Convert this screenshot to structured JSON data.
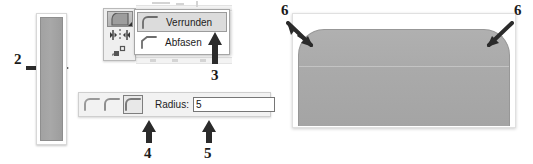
{
  "figure": {
    "callouts": [
      {
        "id": "2",
        "label": "2",
        "target": "rounded-rectangle-preview-bar"
      },
      {
        "id": "3",
        "label": "3",
        "target": "fillet-chamfer-dropdown"
      },
      {
        "id": "4",
        "label": "4",
        "target": "corner-style-button-rounded"
      },
      {
        "id": "5",
        "label": "5",
        "target": "radius-input"
      },
      {
        "id": "6a",
        "label": "6",
        "target": "top-left-rounded-corner"
      },
      {
        "id": "6b",
        "label": "6",
        "target": "top-right-rounded-corner"
      }
    ]
  },
  "preview_bar": {
    "name": "vertical-shape-bar"
  },
  "corner_toolbar": {
    "buttons": [
      {
        "icon": "fillet-corner-icon",
        "active": true,
        "has_dropdown": true
      },
      {
        "icon": "mirror-icon",
        "active": false,
        "has_dropdown": false
      },
      {
        "icon": "rotate-copy-icon",
        "active": false,
        "has_dropdown": false
      }
    ]
  },
  "dropdown": {
    "name": "fillet-chamfer-menu",
    "items": [
      {
        "label": "Verrunden",
        "icon": "rounded-corner-icon",
        "selected": true
      },
      {
        "label": "Abfasen",
        "icon": "chamfer-corner-icon",
        "selected": false
      }
    ]
  },
  "radius_toolbar": {
    "corner_styles": [
      {
        "icon": "corner-style-sharp-icon",
        "active": false
      },
      {
        "icon": "corner-style-chamfer-icon",
        "active": false
      },
      {
        "icon": "corner-style-rounded-icon",
        "active": true
      }
    ],
    "radius_label": "Radius:",
    "radius_value": "5",
    "radius_placeholder": "0"
  },
  "result": {
    "name": "rounded-top-rectangle-result"
  },
  "colors": {
    "shape_fill": "#aaaaaa",
    "shape_stroke": "#979797",
    "menu_highlight": "#dcdcdc",
    "arrow": "#2b2b2b",
    "toolbar_bg": "#f2f2f2"
  }
}
